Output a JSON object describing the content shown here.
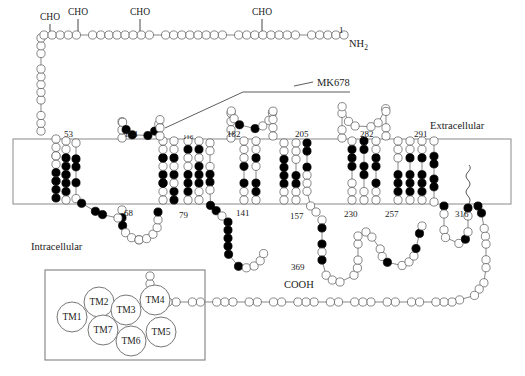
{
  "figure": {
    "type": "gpcr-snake-diagram",
    "membrane": {
      "x": 13,
      "y": 139,
      "width": 498,
      "height": 65
    }
  },
  "labels": {
    "extracellular": "Extracellular",
    "intracellular": "Intracellular",
    "n_terminus": "NH",
    "n_terminus_sub": "2",
    "c_terminus": "COOH",
    "ligand": "MK678",
    "first_residue_number": "1",
    "last_residue_number": "369"
  },
  "glycosylation": {
    "label": "CHO",
    "sites": [
      {
        "x": 50,
        "y": 20,
        "stem_to": 38
      },
      {
        "x": 78,
        "y": 15,
        "stem_to": 36
      },
      {
        "x": 140,
        "y": 15,
        "stem_to": 36
      },
      {
        "x": 262,
        "y": 15,
        "stem_to": 34
      }
    ]
  },
  "boundary_numbers": {
    "extracellular_side": [
      {
        "value": "53",
        "x": 64,
        "y": 137,
        "size": "num"
      },
      {
        "value": "104",
        "x": 124,
        "y": 137,
        "size": "num"
      },
      {
        "value": "116",
        "x": 183,
        "y": 139,
        "size": "numsm"
      },
      {
        "value": "182",
        "x": 227,
        "y": 137,
        "size": "num"
      },
      {
        "value": "205",
        "x": 295,
        "y": 137,
        "size": "num"
      },
      {
        "value": "282",
        "x": 360,
        "y": 137,
        "size": "num"
      },
      {
        "value": "291",
        "x": 414,
        "y": 137,
        "size": "num"
      }
    ],
    "intracellular_side": [
      {
        "value": "68",
        "x": 124,
        "y": 216,
        "size": "num"
      },
      {
        "value": "79",
        "x": 179,
        "y": 218,
        "size": "num"
      },
      {
        "value": "141",
        "x": 236,
        "y": 216,
        "size": "num"
      },
      {
        "value": "157",
        "x": 290,
        "y": 219,
        "size": "num"
      },
      {
        "value": "230",
        "x": 344,
        "y": 217,
        "size": "num"
      },
      {
        "value": "257",
        "x": 385,
        "y": 217,
        "size": "num"
      },
      {
        "value": "316",
        "x": 455,
        "y": 217,
        "size": "num"
      }
    ]
  },
  "tm_legend": {
    "box": {
      "x": 45,
      "y": 270,
      "width": 160,
      "height": 90
    },
    "helices": [
      {
        "label": "TM1",
        "cx": 72,
        "cy": 317,
        "r": 15
      },
      {
        "label": "TM2",
        "cx": 99,
        "cy": 302,
        "r": 15
      },
      {
        "label": "TM3",
        "cx": 126,
        "cy": 310,
        "r": 15
      },
      {
        "label": "TM4",
        "cx": 155,
        "cy": 300,
        "r": 15
      },
      {
        "label": "TM5",
        "cx": 161,
        "cy": 332,
        "r": 15
      },
      {
        "label": "TM6",
        "cx": 131,
        "cy": 341,
        "r": 15
      },
      {
        "label": "TM7",
        "cx": 103,
        "cy": 330,
        "r": 15
      }
    ]
  },
  "residue_colors": {
    "conserved_fill": "#000000",
    "normal_fill": "#ffffff",
    "stroke": "#555555",
    "membrane_stroke": "#8a8a8a"
  },
  "chains": {
    "n_terminal_top": "ANSLNTSVYSGNIDEPISLWTHSGDNLPQDASDM",
    "note": "Single-letter amino acid codes; filled circles mark conserved/highlighted residues"
  }
}
